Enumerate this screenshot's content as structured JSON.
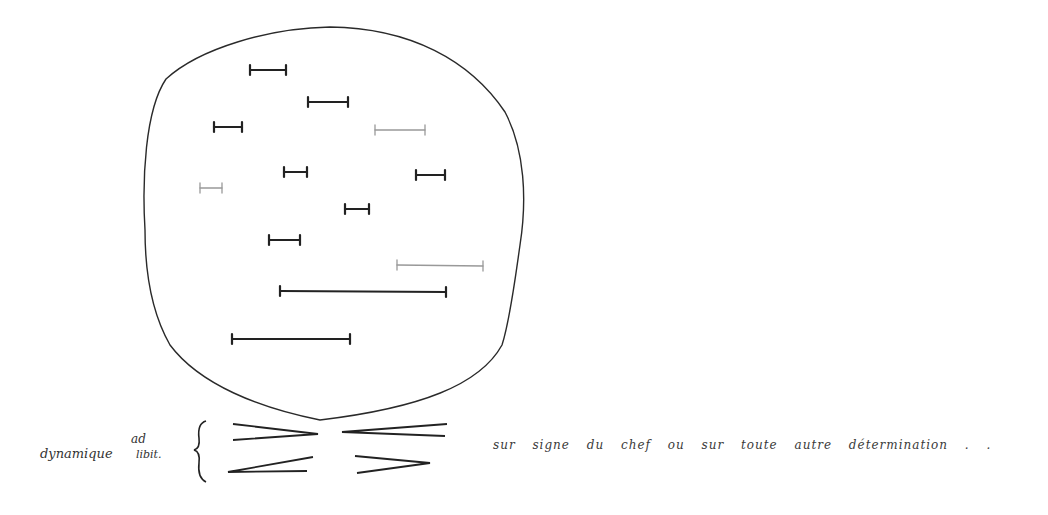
{
  "score": {
    "dynamics_label": "dynamique",
    "adlib_top": "ad",
    "adlib_bottom": "libit.",
    "instruction": "sur signe du chef ou sur toute autre détermination . .",
    "ink_color": "#222222",
    "faint_ink_color": "#999999"
  },
  "circle_segments": [
    {
      "x1": 250,
      "y1": 70,
      "x2": 286,
      "y2": 70,
      "faint": false
    },
    {
      "x1": 308,
      "y1": 102,
      "x2": 348,
      "y2": 102,
      "faint": false
    },
    {
      "x1": 214,
      "y1": 127,
      "x2": 242,
      "y2": 127,
      "faint": false
    },
    {
      "x1": 375,
      "y1": 130,
      "x2": 425,
      "y2": 130,
      "faint": true
    },
    {
      "x1": 284,
      "y1": 172,
      "x2": 307,
      "y2": 172,
      "faint": false
    },
    {
      "x1": 416,
      "y1": 175,
      "x2": 445,
      "y2": 175,
      "faint": false
    },
    {
      "x1": 200,
      "y1": 188,
      "x2": 222,
      "y2": 188,
      "faint": true
    },
    {
      "x1": 345,
      "y1": 209,
      "x2": 369,
      "y2": 209,
      "faint": false
    },
    {
      "x1": 269,
      "y1": 240,
      "x2": 300,
      "y2": 240,
      "faint": false
    },
    {
      "x1": 397,
      "y1": 265,
      "x2": 483,
      "y2": 266,
      "faint": true
    },
    {
      "x1": 280,
      "y1": 291,
      "x2": 446,
      "y2": 292,
      "faint": false
    },
    {
      "x1": 232,
      "y1": 339,
      "x2": 350,
      "y2": 339,
      "faint": false
    }
  ],
  "hairpins": [
    {
      "type": "decrescendo",
      "position": "top-left"
    },
    {
      "type": "crescendo",
      "position": "top-right"
    },
    {
      "type": "crescendo",
      "position": "bottom-left"
    },
    {
      "type": "decrescendo",
      "position": "bottom-right"
    }
  ]
}
